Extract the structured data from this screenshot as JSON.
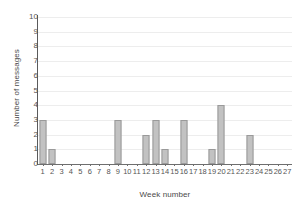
{
  "chart_data": {
    "type": "bar",
    "title": "",
    "xlabel": "Week number",
    "ylabel": "Number of messages",
    "categories": [
      1,
      2,
      3,
      4,
      5,
      6,
      7,
      8,
      9,
      10,
      11,
      12,
      13,
      14,
      15,
      16,
      17,
      18,
      19,
      20,
      21,
      22,
      23,
      24,
      25,
      26,
      27
    ],
    "values": [
      3,
      1,
      0,
      0,
      0,
      0,
      0,
      0,
      3,
      0,
      0,
      2,
      3,
      1,
      0,
      3,
      0,
      0,
      1,
      4,
      0,
      0,
      2,
      0,
      0,
      0,
      0
    ],
    "ylim": [
      0,
      10
    ],
    "y_ticks": [
      0,
      1,
      2,
      3,
      4,
      5,
      6,
      7,
      8,
      9,
      10
    ],
    "xlim": [
      1,
      27
    ],
    "grid": true,
    "legend": "none",
    "colors": {
      "bar_fill": "#c2c2c2",
      "bar_stroke": "#9a9a9a",
      "gridline": "#ededed",
      "axis": "#6e6e6e",
      "text": "#555555",
      "background": "#ffffff"
    }
  }
}
